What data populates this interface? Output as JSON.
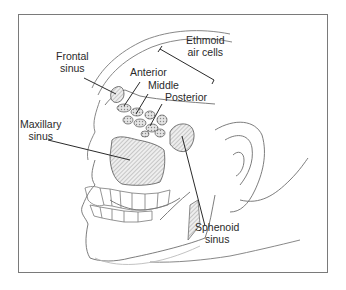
{
  "figure": {
    "border_color": "#7a7a7a",
    "line_color": "#2a2a2a",
    "sketch_color": "#6e6e6e"
  },
  "labels": {
    "frontal_sinus": {
      "line1": "Frontal",
      "line2": "sinus"
    },
    "ethmoid_air_cells": {
      "line1": "Ethmoid",
      "line2": "air cells"
    },
    "anterior": "Anterior",
    "middle": "Middle",
    "posterior": "Posterior",
    "maxillary_sinus": {
      "line1": "Maxillary",
      "line2": "sinus"
    },
    "sphenoid_sinus": {
      "line1": "Sphenoid",
      "line2": "sinus"
    }
  }
}
